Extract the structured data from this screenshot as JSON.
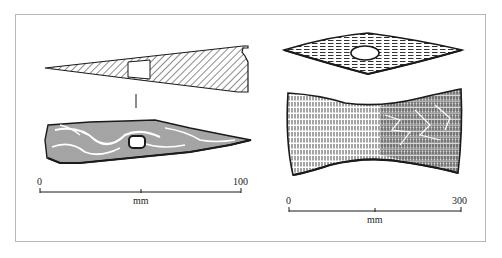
{
  "figure": {
    "left_object": {
      "name": "Tapered wedge-shaped axe head",
      "views": [
        "section",
        "side-view"
      ],
      "scale_bar": {
        "start_label": "0",
        "end_label": "100",
        "unit_label": "mm"
      }
    },
    "right_object": {
      "name": "Double-bladed axe head",
      "views": [
        "top-view",
        "face-view"
      ],
      "scale_bar": {
        "start_label": "0",
        "end_label": "300",
        "unit_label": "mm"
      }
    },
    "colors": {
      "ink": "#1a1a1a",
      "frame": "#b9b9b9",
      "background": "#ffffff"
    }
  }
}
